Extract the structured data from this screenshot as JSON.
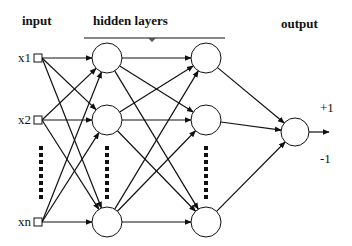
{
  "labels": {
    "input": "input",
    "hidden": "hidden layers",
    "output": "output",
    "plus": "+1",
    "minus": "-1"
  },
  "inputs": [
    {
      "label": "x1",
      "y": 58
    },
    {
      "label": "x2",
      "y": 120
    },
    {
      "label": "xn",
      "y": 222
    }
  ],
  "layers": {
    "input_x": 38,
    "hidden1_x": 107,
    "hidden2_x": 206,
    "output": {
      "x": 295,
      "y": 132
    },
    "node_ys": [
      58,
      120,
      222
    ],
    "node_radius": 15,
    "output_radius": 14
  },
  "colors": {
    "stroke": "#111111",
    "fill": "#ffffff"
  }
}
